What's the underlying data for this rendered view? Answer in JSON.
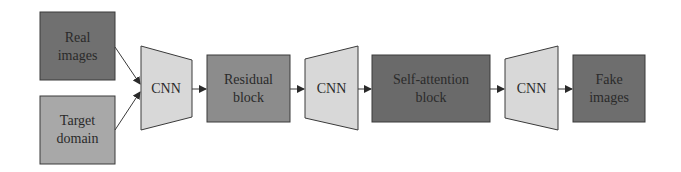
{
  "diagram": {
    "type": "flowchart",
    "nodes": {
      "real_images": {
        "line1": "Real",
        "line2": "images",
        "color": "#707070"
      },
      "target_domain": {
        "line1": "Target",
        "line2": "domain",
        "color": "#a8a8a8"
      },
      "cnn_1": {
        "label": "CNN",
        "color": "#d8d8d8"
      },
      "residual_block": {
        "line1": "Residual",
        "line2": "block",
        "color": "#8c8c8c"
      },
      "cnn_2": {
        "label": "CNN",
        "color": "#d8d8d8"
      },
      "self_attention_block": {
        "line1": "Self-attention",
        "line2": "block",
        "color": "#6a6a6a"
      },
      "cnn_3": {
        "label": "CNN",
        "color": "#d8d8d8"
      },
      "fake_images": {
        "line1": "Fake",
        "line2": "images",
        "color": "#6e6e6e"
      }
    },
    "edges": [
      {
        "from": "real_images",
        "to": "cnn_1"
      },
      {
        "from": "target_domain",
        "to": "cnn_1"
      },
      {
        "from": "cnn_1",
        "to": "residual_block"
      },
      {
        "from": "residual_block",
        "to": "cnn_2"
      },
      {
        "from": "cnn_2",
        "to": "self_attention_block"
      },
      {
        "from": "self_attention_block",
        "to": "cnn_3"
      },
      {
        "from": "cnn_3",
        "to": "fake_images"
      }
    ],
    "stroke_color": "#3a3a3a"
  }
}
